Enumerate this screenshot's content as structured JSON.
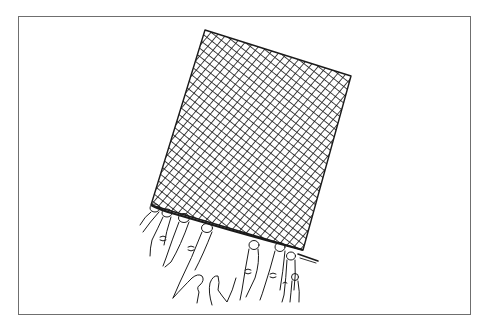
{
  "figure": {
    "frame": {
      "x": 18,
      "y": 16,
      "width": 453,
      "height": 299,
      "border_color": "#6f6f6f"
    },
    "mesh": {
      "corners": [
        [
          205,
          30
        ],
        [
          351,
          76
        ],
        [
          303,
          250
        ],
        [
          151,
          205
        ]
      ],
      "line_color": "#1a1a1a",
      "mesh_spacing_px": 6.5,
      "pattern": "diagonal-crosshatch"
    },
    "needle": {
      "from": [
        298,
        254
      ],
      "to": [
        318,
        261
      ]
    },
    "colors": {
      "background": "#ffffff",
      "ink": "#1a1a1a"
    }
  }
}
